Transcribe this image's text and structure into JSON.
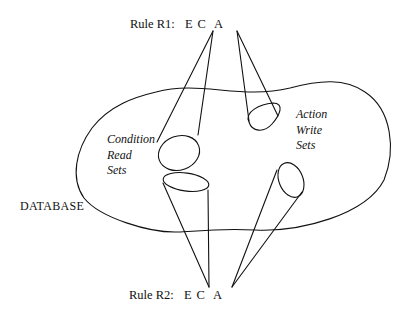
{
  "diagram": {
    "rule1": {
      "label": "Rule R1:",
      "parts": [
        "E",
        "C",
        "A"
      ]
    },
    "rule2": {
      "label": "Rule R2:",
      "parts": [
        "E",
        "C",
        "A"
      ]
    },
    "condition_sets": {
      "line1": "Condition",
      "line2": "Read",
      "line3": "Sets"
    },
    "action_sets": {
      "line1": "Action",
      "line2": "Write",
      "line3": "Sets"
    },
    "region_label": "DATABASE",
    "colors": {
      "stroke": "#111111",
      "background": "#ffffff"
    }
  }
}
